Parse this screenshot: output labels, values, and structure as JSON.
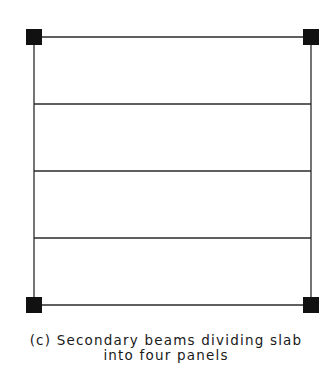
{
  "diagram": {
    "type": "structural-plan",
    "frame": {
      "left": 34,
      "right": 311,
      "top": 37,
      "bottom": 305
    },
    "columns": [
      {
        "name": "top-left",
        "x": 26,
        "y": 29,
        "size": 16
      },
      {
        "name": "top-right",
        "x": 303,
        "y": 29,
        "size": 16
      },
      {
        "name": "bottom-left",
        "x": 26,
        "y": 297,
        "size": 16
      },
      {
        "name": "bottom-right",
        "x": 303,
        "y": 297,
        "size": 16
      }
    ],
    "secondary_beams_y": [
      104,
      171,
      238
    ],
    "panel_count": 4,
    "line_color": "#2a2a2a",
    "column_color": "#111111"
  },
  "caption": {
    "line1": "(c) Secondary beams dividing slab",
    "line2": "into four panels"
  }
}
